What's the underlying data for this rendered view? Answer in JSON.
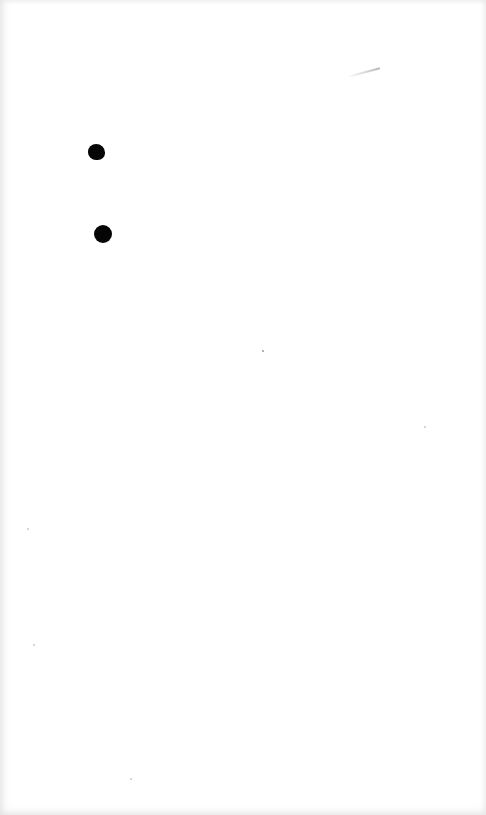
{
  "page": {
    "background": "#ffffff",
    "edge_shade": "#e6e6e6",
    "content": "blank scanned sheet"
  },
  "marks": [
    {
      "type": "ink-dot",
      "color": "#050505",
      "x": 96,
      "y": 152,
      "diameter": 17
    },
    {
      "type": "ink-dot",
      "color": "#050505",
      "x": 103,
      "y": 234,
      "diameter": 18
    },
    {
      "type": "faint-stroke",
      "color": "#b8b8b8",
      "x": 364,
      "y": 76
    }
  ]
}
